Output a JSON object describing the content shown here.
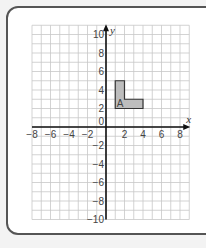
{
  "chart_data": {
    "type": "coordinate-grid",
    "title": "",
    "xlabel": "x",
    "ylabel": "y",
    "xlim": [
      -8,
      9
    ],
    "ylim": [
      -10,
      11
    ],
    "grid": true,
    "x_ticks": [
      -8,
      -6,
      -4,
      -2,
      2,
      4,
      6,
      8
    ],
    "y_ticks": [
      10,
      8,
      6,
      4,
      2,
      -2,
      -4,
      -6,
      -8,
      -10
    ],
    "origin_label": "0",
    "shapes": [
      {
        "name": "A",
        "label": "A",
        "vertices": [
          [
            1,
            2
          ],
          [
            1,
            5
          ],
          [
            2,
            5
          ],
          [
            2,
            3
          ],
          [
            4,
            3
          ],
          [
            4,
            2
          ]
        ],
        "fill": "#bdbdbd",
        "stroke": "#333333"
      }
    ]
  },
  "colors": {
    "grid": "#c8c8c8",
    "axis": "#111111",
    "frame": "#555555"
  }
}
